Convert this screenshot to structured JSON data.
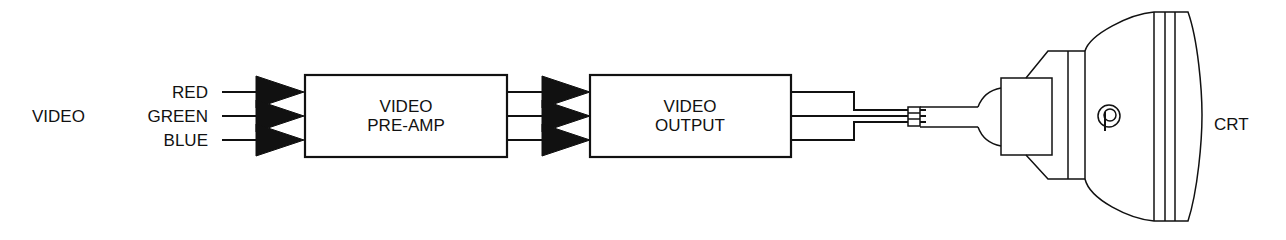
{
  "diagram": {
    "input_group_label": "VIDEO",
    "inputs": [
      {
        "label": "RED",
        "y": 92
      },
      {
        "label": "GREEN",
        "y": 116
      },
      {
        "label": "BLUE",
        "y": 140
      }
    ],
    "blocks": [
      {
        "id": "pre-amp",
        "line1": "VIDEO",
        "line2": "PRE-AMP"
      },
      {
        "id": "output",
        "line1": "VIDEO",
        "line2": "OUTPUT"
      }
    ],
    "output_device": {
      "label": "CRT",
      "logo_glyph": "P"
    },
    "colors": {
      "ink": "#111111",
      "background": "#ffffff"
    }
  }
}
